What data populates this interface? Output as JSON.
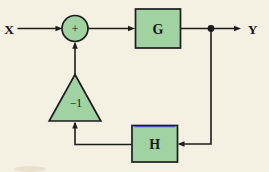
{
  "figure": {
    "input_label": "X",
    "output_label": "Y",
    "summing_junction_symbol": "+",
    "forward_block_label": "G",
    "feedback_block_label": "H",
    "inverter_block_label": "−1"
  },
  "colors": {
    "background": "#f4f0e2",
    "block_fill": "#a0d2a2",
    "line": "#1d1d1d",
    "text": "#161616",
    "artifact_blue": "#3c48b8",
    "artifact_smudge": "#b9876e"
  }
}
